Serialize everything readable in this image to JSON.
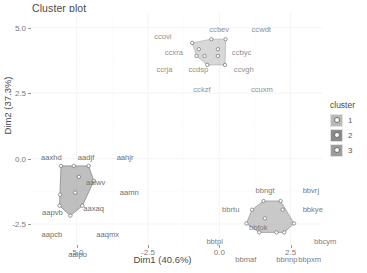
{
  "title": "Cluster plot",
  "axes": {
    "x": {
      "label": "Dim1 (40.6%)",
      "ticks": [
        "-5.0",
        "-2.5",
        "0.0",
        "2.5"
      ],
      "tick_values": [
        -5.0,
        -2.5,
        0.0,
        2.5
      ],
      "range": [
        -6.6,
        3.6
      ]
    },
    "y": {
      "label": "Dim2 (37.3%)",
      "ticks": [
        "5.0",
        "2.5",
        "0.0",
        "-2.5"
      ],
      "tick_values": [
        5.0,
        2.5,
        0.0,
        -2.5
      ],
      "range": [
        -3.3,
        5.6
      ]
    }
  },
  "legend": {
    "title": "cluster",
    "items": [
      {
        "label": "1",
        "color": "#b8b8b8"
      },
      {
        "label": "2",
        "color": "#8a8a8a"
      },
      {
        "label": "3",
        "color": "#9c9c9c"
      }
    ]
  },
  "chart_data": {
    "type": "scatter",
    "title": "Cluster plot",
    "xlabel": "Dim1 (40.6%)",
    "ylabel": "Dim2 (37.3%)",
    "xlim": [
      -6.6,
      3.6
    ],
    "ylim": [
      -3.3,
      5.6
    ],
    "grid": true,
    "legend_position": "right",
    "legend_title": "cluster",
    "series": [
      {
        "name": "1",
        "color": "#b8b8b8",
        "points": [
          {
            "label": "ccovi",
            "x": -0.95,
            "y": 4.42
          },
          {
            "label": "ccbev",
            "x": -0.28,
            "y": 4.56
          },
          {
            "label": "ccwdt",
            "x": 0.22,
            "y": 4.56
          },
          {
            "label": "ccxra",
            "x": -0.72,
            "y": 4.18
          },
          {
            "label": "ccbyc",
            "x": -0.05,
            "y": 4.18
          },
          {
            "label": "ccrja",
            "x": -0.8,
            "y": 3.92
          },
          {
            "label": "ccdsp",
            "x": -0.52,
            "y": 3.92
          },
          {
            "label": "ccvgh",
            "x": -0.05,
            "y": 3.92
          },
          {
            "label": "cckzf",
            "x": -0.42,
            "y": 3.58
          },
          {
            "label": "ccuxm",
            "x": 0.2,
            "y": 3.58
          }
        ]
      },
      {
        "name": "2",
        "color": "#8a8a8a",
        "points": [
          {
            "label": "aaxhd",
            "x": -5.55,
            "y": -0.28
          },
          {
            "label": "aadjf",
            "x": -5.1,
            "y": -0.28
          },
          {
            "label": "aahjr",
            "x": -4.58,
            "y": -0.28
          },
          {
            "label": "aalwv",
            "x": -4.92,
            "y": -0.7
          },
          {
            "label": "aamn",
            "x": -4.4,
            "y": -0.85
          },
          {
            "label": "aapvb",
            "x": -5.58,
            "y": -1.38
          },
          {
            "label": "aaxaq",
            "x": -5.05,
            "y": -1.3
          },
          {
            "label": "aapcb",
            "x": -5.6,
            "y": -1.8
          },
          {
            "label": "aaqmx",
            "x": -4.8,
            "y": -1.8
          },
          {
            "label": "aalpo",
            "x": -5.22,
            "y": -2.18
          }
        ]
      },
      {
        "name": "3",
        "color": "#9c9c9c",
        "points": [
          {
            "label": "bbngt",
            "x": 1.55,
            "y": -1.62
          },
          {
            "label": "bbvrj",
            "x": 2.15,
            "y": -1.62
          },
          {
            "label": "bbrtu",
            "x": 1.15,
            "y": -1.95
          },
          {
            "label": "bbkye",
            "x": 2.22,
            "y": -1.95
          },
          {
            "label": "bbfok",
            "x": 1.6,
            "y": -2.28
          },
          {
            "label": "bbtpl",
            "x": 0.95,
            "y": -2.48
          },
          {
            "label": "bbcym",
            "x": 2.62,
            "y": -2.48
          },
          {
            "label": "bbmaf",
            "x": 1.4,
            "y": -2.82
          },
          {
            "label": "bbnnp",
            "x": 2.0,
            "y": -2.82
          },
          {
            "label": "bbpxm",
            "x": 2.28,
            "y": -2.82
          }
        ]
      }
    ]
  }
}
